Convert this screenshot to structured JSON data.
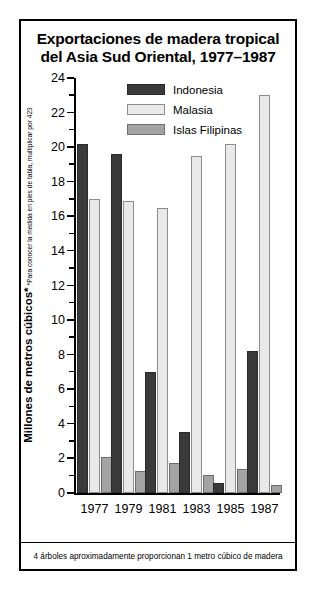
{
  "chart_data": {
    "type": "bar",
    "title": "Exportaciones de madera tropical del Asia Sud Oriental, 1977–1987",
    "title_lines": [
      "Exportaciones de madera tropical",
      "del Asia Sud Oriental, 1977–1987"
    ],
    "categories": [
      "1977",
      "1979",
      "1981",
      "1983",
      "1985",
      "1987"
    ],
    "series": [
      {
        "name": "Indonesia",
        "color": "#3a3a3a",
        "values": [
          20.2,
          19.6,
          7.0,
          3.5,
          0.6,
          8.2
        ]
      },
      {
        "name": "Malasia",
        "color": "#e9e9e9",
        "values": [
          17.0,
          16.9,
          16.5,
          19.5,
          20.2,
          23.0
        ]
      },
      {
        "name": "Islas Filipinas",
        "color": "#a3a3a3",
        "values": [
          2.1,
          1.3,
          1.75,
          1.05,
          1.4,
          0.45
        ]
      }
    ],
    "xlabel": "",
    "ylabel": "Millones de metros cúbicos*",
    "ylabel_note": "*Para conocer la medida en pies de tabla, multiplicar por 423",
    "ylim": [
      0,
      24
    ],
    "ytick_step": 2,
    "yticks": [
      "0",
      "2",
      "4",
      "6",
      "8",
      "10",
      "12",
      "14",
      "16",
      "18",
      "20",
      "22",
      "24"
    ],
    "minor_ticks": [
      1,
      3,
      5,
      7,
      9,
      11,
      13,
      15,
      17,
      19,
      21,
      23
    ],
    "grid": false,
    "legend_position": "upper-left-inside",
    "footnote": "4 árboles aproximadamente proporcionan 1 metro cúbico de madera"
  }
}
